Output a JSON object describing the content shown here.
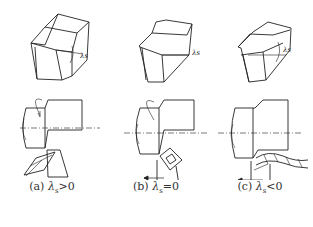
{
  "figure": {
    "panels": [
      {
        "id": "a",
        "label": "(a)",
        "symbol": "λ",
        "subscript": "s",
        "relation": ">0",
        "angle_label": "λs",
        "chip_direction": "down-left"
      },
      {
        "id": "b",
        "label": "(b)",
        "symbol": "λ",
        "subscript": "s",
        "relation": "=0",
        "angle_label": "λs",
        "chip_direction": "curl"
      },
      {
        "id": "c",
        "label": "(c)",
        "symbol": "λ",
        "subscript": "s",
        "relation": "<0",
        "angle_label": "λs",
        "chip_direction": "right"
      }
    ],
    "colors": {
      "line": "#222222",
      "background": "#ffffff"
    }
  }
}
